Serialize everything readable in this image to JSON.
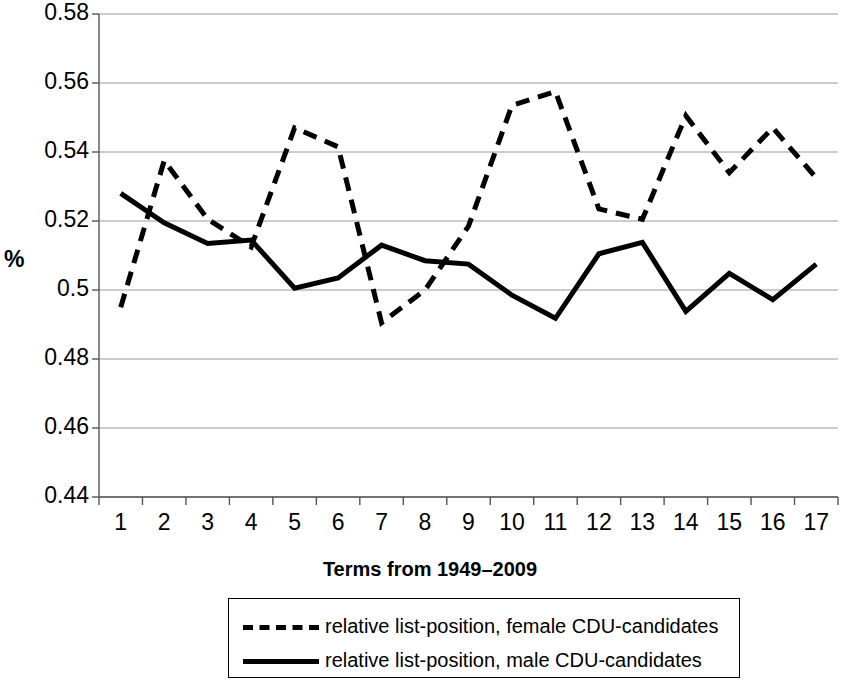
{
  "chart_data": {
    "type": "line",
    "title": "",
    "xlabel": "Terms from 1949–2009",
    "ylabel": "%",
    "categories": [
      "1",
      "2",
      "3",
      "4",
      "5",
      "6",
      "7",
      "8",
      "9",
      "10",
      "11",
      "12",
      "13",
      "14",
      "15",
      "16",
      "17"
    ],
    "ylim": [
      0.44,
      0.58
    ],
    "y_ticks": [
      "0.44",
      "0.46",
      "0.48",
      "0.5",
      "0.52",
      "0.54",
      "0.56",
      "0.58"
    ],
    "y_tick_values": [
      0.44,
      0.46,
      0.48,
      0.5,
      0.52,
      0.54,
      0.56,
      0.58
    ],
    "grid": "horizontal",
    "legend_position": "bottom",
    "series": [
      {
        "name": "relative list-position, female CDU-candidates",
        "style": "dashed",
        "color": "#000000",
        "values": [
          0.495,
          0.5375,
          0.5205,
          0.5125,
          0.547,
          0.5415,
          0.4905,
          0.5,
          0.5185,
          0.5535,
          0.5575,
          0.5235,
          0.5205,
          0.5505,
          0.534,
          0.547,
          0.5325
        ]
      },
      {
        "name": "relative list-position, male CDU-candidates",
        "style": "solid",
        "color": "#000000",
        "values": [
          0.528,
          0.5195,
          0.5135,
          0.5145,
          0.5005,
          0.5035,
          0.513,
          0.5085,
          0.5075,
          0.4985,
          0.4918,
          0.5105,
          0.5138,
          0.4938,
          0.5048,
          0.4972,
          0.5075
        ]
      }
    ]
  },
  "axis": {
    "y_title": "%",
    "x_title": "Terms from 1949–2009"
  },
  "legend": {
    "items": [
      {
        "label": "relative list-position, female CDU-candidates",
        "style": "dashed"
      },
      {
        "label": "relative list-position, male CDU-candidates",
        "style": "solid"
      }
    ]
  },
  "geometry": {
    "plot_left": 99,
    "plot_right": 838,
    "plot_top": 14,
    "plot_bottom": 497
  }
}
